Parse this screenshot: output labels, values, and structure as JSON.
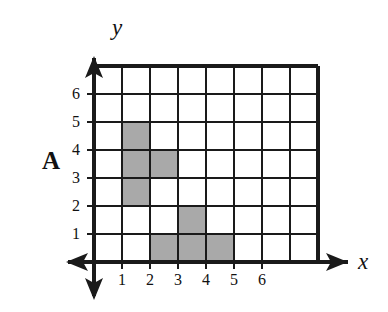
{
  "figure": {
    "panel_label": "A",
    "axis_x_name": "x",
    "axis_y_name": "y",
    "shade_color": "#a9a9a9",
    "line_color": "#1a1a1a",
    "background_color": "#ffffff"
  },
  "axes": {
    "x_tick_labels": [
      "1",
      "2",
      "3",
      "4",
      "5",
      "6"
    ],
    "y_tick_labels": [
      "1",
      "2",
      "3",
      "4",
      "5",
      "6"
    ],
    "x_range": [
      0,
      7
    ],
    "y_range": [
      0,
      7
    ],
    "x_arrow_directions": [
      "left",
      "right"
    ],
    "y_arrow_directions": [
      "up",
      "down"
    ]
  },
  "chart_data": {
    "type": "grid",
    "title": "A",
    "xlabel": "x",
    "ylabel": "y",
    "xlim": [
      0,
      7
    ],
    "ylim": [
      0,
      7
    ],
    "grid": true,
    "cell_size": 1,
    "columns": 7,
    "rows": 7,
    "x_ticks": [
      1,
      2,
      3,
      4,
      5,
      6
    ],
    "y_ticks": [
      1,
      2,
      3,
      4,
      5,
      6
    ],
    "shaded_cells": [
      {
        "x": 1,
        "y": 4
      },
      {
        "x": 1,
        "y": 3
      },
      {
        "x": 1,
        "y": 2
      },
      {
        "x": 2,
        "y": 3
      },
      {
        "x": 3,
        "y": 1
      },
      {
        "x": 2,
        "y": 0
      },
      {
        "x": 3,
        "y": 0
      },
      {
        "x": 4,
        "y": 0
      }
    ],
    "shaded_cell_count": 8,
    "regions": [
      {
        "name": "upper-shape",
        "cells": [
          [
            1,
            4
          ],
          [
            1,
            3
          ],
          [
            1,
            2
          ],
          [
            2,
            3
          ]
        ],
        "outline": [
          [
            1,
            5
          ],
          [
            2,
            5
          ],
          [
            2,
            4
          ],
          [
            3,
            4
          ],
          [
            3,
            3
          ],
          [
            2,
            3
          ],
          [
            2,
            2
          ],
          [
            1,
            2
          ]
        ]
      },
      {
        "name": "lower-shape",
        "cells": [
          [
            3,
            1
          ],
          [
            2,
            0
          ],
          [
            3,
            0
          ],
          [
            4,
            0
          ]
        ],
        "outline": [
          [
            3,
            2
          ],
          [
            4,
            2
          ],
          [
            4,
            1
          ],
          [
            5,
            1
          ],
          [
            5,
            0
          ],
          [
            2,
            0
          ],
          [
            2,
            1
          ],
          [
            3,
            1
          ]
        ]
      }
    ]
  }
}
